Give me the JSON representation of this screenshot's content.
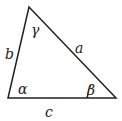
{
  "diagram": {
    "type": "triangle",
    "sides": {
      "a": "a",
      "b": "b",
      "c": "c"
    },
    "angles": {
      "alpha": "α",
      "beta": "β",
      "gamma": "γ"
    },
    "stroke_color": "#222222"
  }
}
